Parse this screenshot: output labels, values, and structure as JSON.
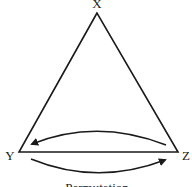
{
  "diagram": {
    "vertices": {
      "top": {
        "label": "X"
      },
      "left": {
        "label": "Y"
      },
      "right": {
        "label": "Z"
      }
    },
    "arrows": [
      {
        "from": "Z",
        "to": "Y",
        "position": "above-base"
      },
      {
        "from": "Y",
        "to": "Z",
        "position": "below-base"
      }
    ],
    "caption": "Permutation",
    "colors": {
      "stroke": "#1a1a1a",
      "background": "#ffffff"
    }
  }
}
